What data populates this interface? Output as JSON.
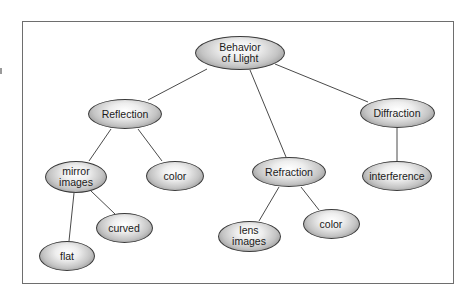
{
  "diagram": {
    "type": "concept-map",
    "root": "Behavior of Llight",
    "nodes": {
      "root": {
        "label": "Behavior\nof Llight",
        "cx": 240,
        "cy": 53,
        "w": 90,
        "h": 34
      },
      "reflection": {
        "label": "Reflection",
        "cx": 125,
        "cy": 114,
        "w": 74,
        "h": 30
      },
      "diffraction": {
        "label": "Diffraction",
        "cx": 397,
        "cy": 113,
        "w": 75,
        "h": 30
      },
      "refraction": {
        "label": "Refraction",
        "cx": 289,
        "cy": 172,
        "w": 74,
        "h": 30
      },
      "mirror_images": {
        "label": "mirror\nimages",
        "cx": 76,
        "cy": 177,
        "w": 62,
        "h": 32
      },
      "color_reflection": {
        "label": "color",
        "cx": 175,
        "cy": 176,
        "w": 58,
        "h": 30
      },
      "interference": {
        "label": "interference",
        "cx": 397,
        "cy": 176,
        "w": 70,
        "h": 30
      },
      "curved": {
        "label": "curved",
        "cx": 124,
        "cy": 228,
        "w": 57,
        "h": 30
      },
      "flat": {
        "label": "flat",
        "cx": 67,
        "cy": 256,
        "w": 56,
        "h": 30
      },
      "lens_images": {
        "label": "lens\nimages",
        "cx": 249,
        "cy": 236,
        "w": 63,
        "h": 31
      },
      "color_refraction": {
        "label": "color",
        "cx": 331,
        "cy": 224,
        "w": 57,
        "h": 30
      }
    },
    "edges": [
      {
        "from": "Behavior of Llight",
        "to": "Reflection"
      },
      {
        "from": "Behavior of Llight",
        "to": "Refraction"
      },
      {
        "from": "Behavior of Llight",
        "to": "Diffraction"
      },
      {
        "from": "Reflection",
        "to": "mirror images"
      },
      {
        "from": "Reflection",
        "to": "color"
      },
      {
        "from": "mirror images",
        "to": "flat"
      },
      {
        "from": "mirror images",
        "to": "curved"
      },
      {
        "from": "Refraction",
        "to": "lens images"
      },
      {
        "from": "Refraction",
        "to": "color"
      },
      {
        "from": "Diffraction",
        "to": "interference"
      }
    ],
    "colors": {
      "line": "#4a4a4a",
      "frame": "#6e6e6e",
      "node_fill_light": "#ffffff",
      "node_fill_dark": "#6a6a6a",
      "text": "#1a1a1a"
    }
  }
}
